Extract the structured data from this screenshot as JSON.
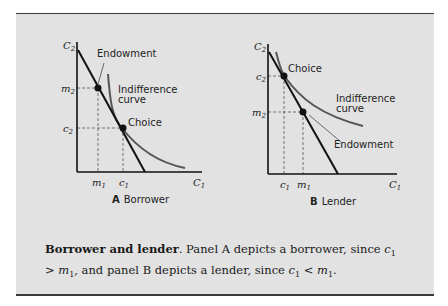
{
  "panels": [
    {
      "id": "A",
      "letter": "A",
      "title": "Borrower",
      "y_axis_label": "C",
      "y_axis_sub": "2",
      "x_axis_label": "C",
      "x_axis_sub": "1",
      "y_ticks": [
        {
          "label": "m",
          "sub": "2"
        },
        {
          "label": "c",
          "sub": "2"
        }
      ],
      "x_ticks": [
        {
          "label": "m",
          "sub": "1"
        },
        {
          "label": "c",
          "sub": "1"
        }
      ],
      "annotations": {
        "endowment": "Endowment",
        "indifference_line1": "Indifference",
        "indifference_line2": "curve",
        "choice": "Choice"
      }
    },
    {
      "id": "B",
      "letter": "B",
      "title": "Lender",
      "y_axis_label": "C",
      "y_axis_sub": "2",
      "x_axis_label": "C",
      "x_axis_sub": "1",
      "y_ticks": [
        {
          "label": "c",
          "sub": "2"
        },
        {
          "label": "m",
          "sub": "2"
        }
      ],
      "x_ticks": [
        {
          "label": "c",
          "sub": "1"
        },
        {
          "label": "m",
          "sub": "1"
        }
      ],
      "annotations": {
        "choice": "Choice",
        "indifference_line1": "Indifference",
        "indifference_line2": "curve",
        "endowment": "Endowment"
      }
    }
  ],
  "caption": {
    "title": "Borrower and lender",
    "text_1": ". Panel A depicts a borrower, since ",
    "c1": "c",
    "c1_sub": "1",
    "gt": " > ",
    "m1": "m",
    "m1_sub": "1",
    "text_2": ", and panel B depicts a lender, since ",
    "c1b": "c",
    "c1b_sub": "1",
    "lt": " < ",
    "m1b": "m",
    "m1b_sub": "1",
    "text_3": "."
  },
  "colors": {
    "background": "#e2e2e2",
    "budget_line": "#111111",
    "indifference_curve": "#555555",
    "dashed": "#555555"
  }
}
